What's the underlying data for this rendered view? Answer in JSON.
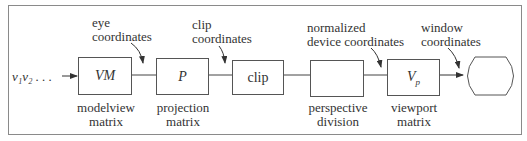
{
  "diagram": {
    "input_label": "v₁v₂ . . .",
    "stages": [
      {
        "id": "modelview",
        "box_text": "VM",
        "italic": true,
        "caption_line1": "modelview",
        "caption_line2": "matrix"
      },
      {
        "id": "projection",
        "box_text": "P",
        "italic": true,
        "caption_line1": "projection",
        "caption_line2": "matrix"
      },
      {
        "id": "clip",
        "box_text": "clip",
        "italic": false,
        "caption_line1": "",
        "caption_line2": ""
      },
      {
        "id": "perspective-division",
        "box_text": "",
        "italic": false,
        "caption_line1": "perspective",
        "caption_line2": "division"
      },
      {
        "id": "viewport",
        "box_text": "V",
        "box_sub": "p",
        "italic": true,
        "caption_line1": "viewport",
        "caption_line2": "matrix"
      },
      {
        "id": "output-terminal",
        "box_text": "",
        "italic": false
      }
    ],
    "coordinate_labels": [
      {
        "line1": "eye",
        "line2": "coordinates"
      },
      {
        "line1": "clip",
        "line2": "coordinates"
      },
      {
        "line1": "normalized",
        "line2": "device coordinates"
      },
      {
        "line1": "window",
        "line2": "coordinates"
      }
    ]
  }
}
